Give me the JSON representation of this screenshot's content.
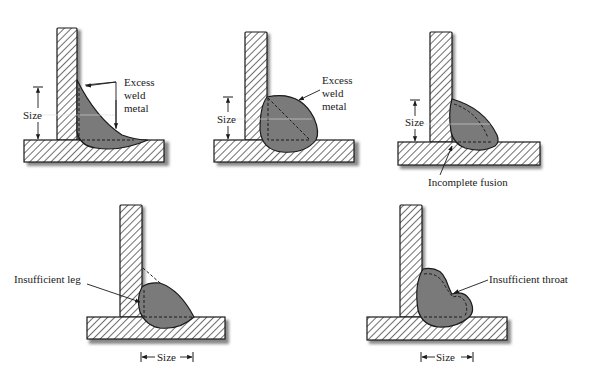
{
  "figures": [
    {
      "id": "excess-weld-concave",
      "label_lines": [
        "Excess",
        "weld",
        "metal"
      ],
      "size_label": "Size"
    },
    {
      "id": "excess-weld-convex",
      "label_lines": [
        "Excess",
        "weld",
        "metal"
      ],
      "size_label": "Size"
    },
    {
      "id": "incomplete-fusion",
      "label": "Incomplete fusion",
      "size_label": "Size"
    },
    {
      "id": "insufficient-leg",
      "label": "Insufficient leg",
      "size_label": "Size"
    },
    {
      "id": "insufficient-throat",
      "label": "Insufficient throat",
      "size_label": "Size"
    }
  ],
  "colors": {
    "weld_fill": "#7a7a7a",
    "plate_fill": "#ffffff",
    "outline": "#1a1a1a",
    "shadow": "#9a9a9a"
  }
}
